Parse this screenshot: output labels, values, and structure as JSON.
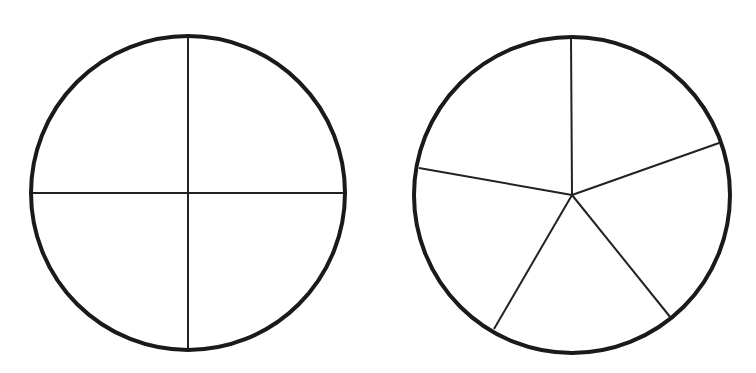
{
  "diagram": {
    "title": "",
    "stroke_color": "#1a1a1a",
    "background": "#ffffff",
    "circles": [
      {
        "name": "circle-quarters",
        "parts": 4,
        "center": [
          188,
          193
        ],
        "radius": 157,
        "dividers": [
          {
            "x1": 188,
            "y1": 36,
            "x2": 188,
            "y2": 350
          },
          {
            "x1": 31,
            "y1": 193,
            "x2": 345,
            "y2": 193
          }
        ]
      },
      {
        "name": "circle-fifths",
        "parts": 5,
        "center": [
          572,
          195
        ],
        "radius": 158,
        "dividers": [
          {
            "x1": 572,
            "y1": 195,
            "x2": 571,
            "y2": 37
          },
          {
            "x1": 572,
            "y1": 195,
            "x2": 719,
            "y2": 143
          },
          {
            "x1": 572,
            "y1": 195,
            "x2": 671,
            "y2": 318
          },
          {
            "x1": 572,
            "y1": 195,
            "x2": 494,
            "y2": 329
          },
          {
            "x1": 572,
            "y1": 195,
            "x2": 419,
            "y2": 168
          }
        ]
      }
    ]
  }
}
